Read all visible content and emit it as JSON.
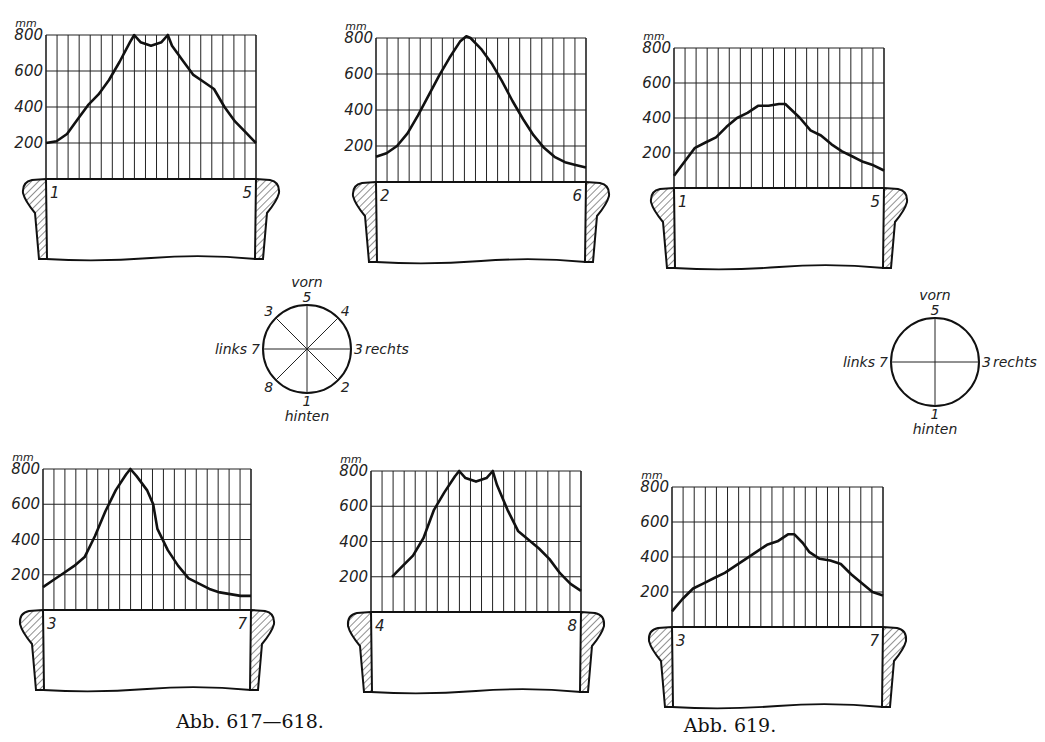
{
  "page": {
    "captions": [
      {
        "text": "Abb. 617—618.",
        "x": 250,
        "y": 728
      },
      {
        "text": "Abb. 619.",
        "x": 730,
        "y": 732
      }
    ]
  },
  "diagrams": [
    {
      "labels": {
        "front": "vorn",
        "back": "hinten",
        "left": "links",
        "right": "rechts"
      },
      "cx": 307,
      "cy": 349,
      "r": 44,
      "spokes": 8,
      "points": [
        {
          "label": "5",
          "angle": 270
        },
        {
          "label": "4",
          "angle": 315
        },
        {
          "label": "3",
          "angle": 0,
          "suffix": "rechts"
        },
        {
          "label": "2",
          "angle": 45
        },
        {
          "label": "1",
          "angle": 90
        },
        {
          "label": "8",
          "angle": 135
        },
        {
          "label": "7",
          "angle": 180,
          "prefix": "links"
        },
        {
          "label": "3",
          "angle": 225
        }
      ]
    },
    {
      "labels": {
        "front": "vorn",
        "back": "hinten",
        "left": "links",
        "right": "rechts"
      },
      "cx": 935,
      "cy": 362,
      "r": 44,
      "spokes": 4,
      "points": [
        {
          "label": "5",
          "angle": 270
        },
        {
          "label": "3",
          "angle": 0,
          "suffix": "rechts"
        },
        {
          "label": "1",
          "angle": 90
        },
        {
          "label": "7",
          "angle": 180,
          "prefix": "links"
        }
      ]
    }
  ],
  "chart_data": [
    {
      "type": "line",
      "title": "Abb. 617 (1–5)",
      "unit": "mm",
      "yticks": [
        200,
        400,
        600,
        800
      ],
      "ylim": [
        0,
        800
      ],
      "left_label": "1",
      "right_label": "5",
      "box": {
        "x0": 46,
        "x1": 256,
        "y0": 35,
        "y1": 179
      },
      "x": [
        0,
        0.05,
        0.1,
        0.15,
        0.2,
        0.25,
        0.3,
        0.35,
        0.4,
        0.42,
        0.45,
        0.5,
        0.55,
        0.58,
        0.6,
        0.65,
        0.7,
        0.75,
        0.8,
        0.85,
        0.9,
        0.95,
        1.0
      ],
      "values": [
        200,
        210,
        250,
        330,
        410,
        470,
        550,
        650,
        760,
        800,
        760,
        740,
        760,
        800,
        740,
        660,
        580,
        540,
        500,
        400,
        320,
        260,
        200
      ]
    },
    {
      "type": "line",
      "title": "Abb. 617 (2–6)",
      "unit": "mm",
      "yticks": [
        200,
        400,
        600,
        800
      ],
      "ylim": [
        0,
        800
      ],
      "left_label": "2",
      "right_label": "6",
      "box": {
        "x0": 376,
        "x1": 586,
        "y0": 38,
        "y1": 182
      },
      "x": [
        0,
        0.05,
        0.1,
        0.15,
        0.2,
        0.25,
        0.3,
        0.35,
        0.4,
        0.43,
        0.45,
        0.5,
        0.55,
        0.6,
        0.65,
        0.7,
        0.75,
        0.8,
        0.85,
        0.9,
        0.95,
        1.0
      ],
      "values": [
        140,
        160,
        200,
        270,
        370,
        480,
        590,
        690,
        780,
        810,
        800,
        740,
        660,
        560,
        450,
        350,
        260,
        190,
        140,
        110,
        95,
        80
      ]
    },
    {
      "type": "line",
      "title": "Abb. 619 (1–5)",
      "unit": "mm",
      "yticks": [
        200,
        400,
        600,
        800
      ],
      "ylim": [
        0,
        800
      ],
      "left_label": "1",
      "right_label": "5",
      "box": {
        "x0": 674,
        "x1": 884,
        "y0": 48,
        "y1": 188
      },
      "x": [
        0,
        0.05,
        0.1,
        0.15,
        0.2,
        0.25,
        0.3,
        0.35,
        0.4,
        0.45,
        0.5,
        0.53,
        0.6,
        0.65,
        0.7,
        0.75,
        0.8,
        0.85,
        0.9,
        0.95,
        1.0
      ],
      "values": [
        70,
        150,
        230,
        260,
        290,
        350,
        400,
        430,
        470,
        470,
        480,
        480,
        400,
        330,
        300,
        250,
        210,
        180,
        150,
        130,
        100
      ]
    },
    {
      "type": "line",
      "title": "Abb. 618 (3–7)",
      "unit": "mm",
      "yticks": [
        200,
        400,
        600,
        800
      ],
      "ylim": [
        0,
        800
      ],
      "left_label": "3",
      "right_label": "7",
      "box": {
        "x0": 43,
        "x1": 251,
        "y0": 469,
        "y1": 610
      },
      "x": [
        0,
        0.05,
        0.1,
        0.15,
        0.2,
        0.25,
        0.3,
        0.35,
        0.4,
        0.42,
        0.45,
        0.5,
        0.53,
        0.55,
        0.6,
        0.65,
        0.7,
        0.75,
        0.8,
        0.85,
        0.9,
        0.95,
        1.0
      ],
      "values": [
        130,
        170,
        210,
        250,
        300,
        420,
        560,
        680,
        770,
        800,
        760,
        680,
        600,
        460,
        340,
        250,
        180,
        150,
        120,
        100,
        90,
        80,
        80
      ]
    },
    {
      "type": "line",
      "title": "Abb. 618 (4–8)",
      "unit": "mm",
      "yticks": [
        200,
        400,
        600,
        800
      ],
      "ylim": [
        0,
        800
      ],
      "left_label": "4",
      "right_label": "8",
      "box": {
        "x0": 371,
        "x1": 581,
        "y0": 471,
        "y1": 612
      },
      "x": [
        0.1,
        0.15,
        0.2,
        0.25,
        0.3,
        0.35,
        0.4,
        0.42,
        0.45,
        0.5,
        0.55,
        0.58,
        0.6,
        0.65,
        0.7,
        0.75,
        0.8,
        0.85,
        0.9,
        0.95,
        1.0
      ],
      "values": [
        200,
        260,
        320,
        420,
        580,
        680,
        770,
        800,
        760,
        740,
        760,
        800,
        720,
        580,
        460,
        410,
        360,
        300,
        220,
        160,
        120
      ]
    },
    {
      "type": "line",
      "title": "Abb. 619 (3–7)",
      "unit": "mm",
      "yticks": [
        200,
        400,
        600,
        800
      ],
      "ylim": [
        0,
        800
      ],
      "left_label": "3",
      "right_label": "7",
      "box": {
        "x0": 672,
        "x1": 883,
        "y0": 487,
        "y1": 627
      },
      "x": [
        0,
        0.05,
        0.1,
        0.15,
        0.2,
        0.25,
        0.3,
        0.35,
        0.4,
        0.45,
        0.5,
        0.55,
        0.58,
        0.62,
        0.65,
        0.7,
        0.75,
        0.8,
        0.85,
        0.9,
        0.95,
        1.0
      ],
      "values": [
        90,
        160,
        220,
        250,
        280,
        310,
        350,
        390,
        430,
        470,
        490,
        530,
        530,
        480,
        430,
        390,
        380,
        360,
        300,
        250,
        200,
        180
      ]
    }
  ]
}
